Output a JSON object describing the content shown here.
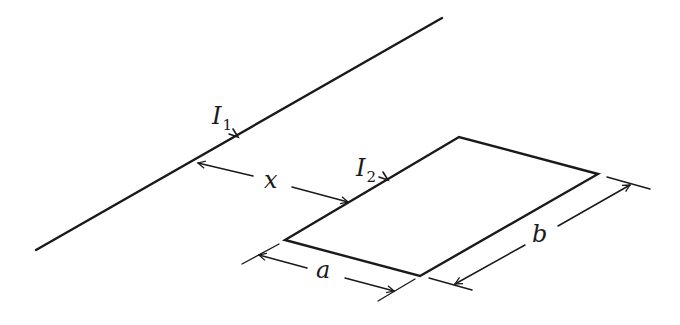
{
  "diagram": {
    "labels": {
      "current1": {
        "main": "I",
        "sub": "1"
      },
      "current2": {
        "main": "I",
        "sub": "2"
      },
      "distance": "x",
      "side_a": "a",
      "side_b": "b"
    },
    "wire": {
      "x1": 36,
      "y1": 250,
      "x2": 442,
      "y2": 18
    },
    "loop": {
      "corners": [
        [
          285,
          240
        ],
        [
          459,
          137
        ],
        [
          598,
          174
        ],
        [
          420,
          276
        ]
      ]
    },
    "stroke_color": "#1a1a1a"
  }
}
